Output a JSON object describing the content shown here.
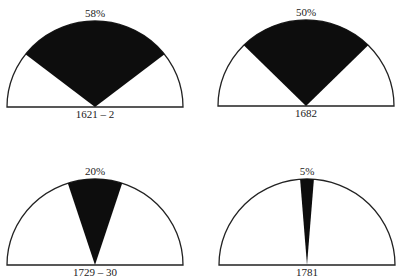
{
  "chart_data": [
    {
      "type": "pie",
      "subtype": "semicircle-sector",
      "title": "58%",
      "value_pct": 58,
      "label": "1621 – 2"
    },
    {
      "type": "pie",
      "subtype": "semicircle-sector",
      "title": "50%",
      "value_pct": 50,
      "label": "1682"
    },
    {
      "type": "pie",
      "subtype": "semicircle-sector",
      "title": "20%",
      "value_pct": 20,
      "label": "1729 – 30"
    },
    {
      "type": "pie",
      "subtype": "semicircle-sector",
      "title": "5%",
      "value_pct": 5,
      "label": "1781"
    }
  ],
  "panels": [
    {
      "pct": "58%",
      "year": "1621 – 2"
    },
    {
      "pct": "50%",
      "year": "1682"
    },
    {
      "pct": "20%",
      "year": "1729 – 30"
    },
    {
      "pct": "5%",
      "year": "1781"
    }
  ],
  "colors": {
    "fill": "#0d0d0d",
    "stroke": "#222222",
    "background": "#ffffff"
  }
}
